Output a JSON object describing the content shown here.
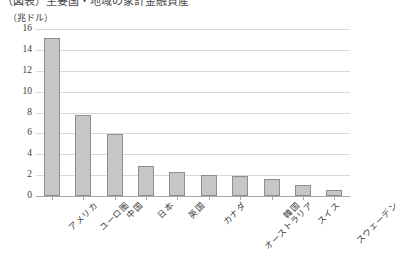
{
  "title": {
    "text": "（図表）主要国・地域の家計金融資産",
    "visible_fragment": "cropped"
  },
  "unit_label": "（兆ドル）",
  "chart_data": {
    "type": "bar",
    "title": "",
    "xlabel": "",
    "ylabel": "（兆ドル）",
    "ylim": [
      0,
      16
    ],
    "ytick_step": 2,
    "grid": true,
    "legend": "none",
    "categories": [
      "アメリカ",
      "ユーロ圏",
      "中国",
      "日本",
      "英国",
      "カナダ",
      "オーストラリア",
      "韓国",
      "スイス",
      "スウェーデン"
    ],
    "values": [
      15.1,
      7.8,
      5.9,
      2.9,
      2.3,
      2.0,
      1.9,
      1.6,
      1.1,
      0.6
    ],
    "yticks": [
      "0",
      "2",
      "4",
      "6",
      "8",
      "10",
      "12",
      "14",
      "16"
    ],
    "bar_fill": "#c6c6c6",
    "bar_border": "#8e8e8e",
    "gridline_color": "#d9d9d9",
    "axis_color": "#a8a8a8"
  }
}
